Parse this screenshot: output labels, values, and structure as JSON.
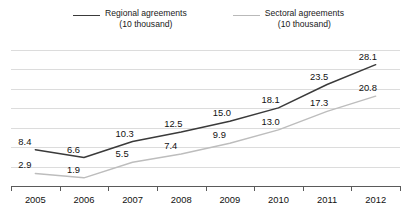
{
  "legend": {
    "items": [
      {
        "name": "Regional agreements",
        "unit": "(10 thousand)",
        "color": "#3a3a3a"
      },
      {
        "name": "Sectoral agreements",
        "unit": "(10 thousand)",
        "color": "#bdbdbd"
      }
    ]
  },
  "chart_data": {
    "type": "line",
    "title": "",
    "xlabel": "",
    "ylabel": "",
    "grid": true,
    "legend_position": "top",
    "categories": [
      "2005",
      "2006",
      "2007",
      "2008",
      "2009",
      "2010",
      "2011",
      "2012"
    ],
    "ylim": [
      0,
      31.5
    ],
    "series": [
      {
        "name": "Regional agreements (10 thousand)",
        "color": "#3a3a3a",
        "values": [
          8.4,
          6.6,
          10.3,
          12.5,
          15.0,
          18.1,
          23.5,
          28.1
        ],
        "labels": [
          "8.4",
          "6.6",
          "10.3",
          "12.5",
          "15.0",
          "18.1",
          "23.5",
          "28.1"
        ]
      },
      {
        "name": "Sectoral agreements (10 thousand)",
        "color": "#bdbdbd",
        "values": [
          2.9,
          1.9,
          5.5,
          7.4,
          9.9,
          13.0,
          17.3,
          20.8
        ],
        "labels": [
          "2.9",
          "1.9",
          "5.5",
          "7.4",
          "9.9",
          "13.0",
          "17.3",
          "20.8"
        ]
      }
    ]
  }
}
